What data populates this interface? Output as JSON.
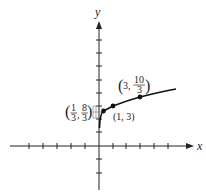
{
  "figure": {
    "axis_labels": {
      "x": "x",
      "y": "y"
    },
    "points": [
      {
        "label_a": "1",
        "label_b": "3",
        "label_c": "8",
        "label_d": "3",
        "text": "(1/3, 8/3)"
      },
      {
        "text": "(1, 3)"
      },
      {
        "label_a": "10",
        "label_b": "3",
        "text": "(3, 10/3)"
      }
    ],
    "labels": {
      "p1_open": "(",
      "p1_num1": "1",
      "p1_den1": "3",
      "p1_comma": ",",
      "p1_num2": "8",
      "p1_den2": "3",
      "p1_close": ")",
      "p2": "(1, 3)",
      "p3_open": "(",
      "p3_x": "3,",
      "p3_num": "10",
      "p3_den": "3",
      "p3_close": ")"
    },
    "colors": {
      "curve": "#111111",
      "axis": "#222222",
      "guide": "#888888"
    }
  }
}
